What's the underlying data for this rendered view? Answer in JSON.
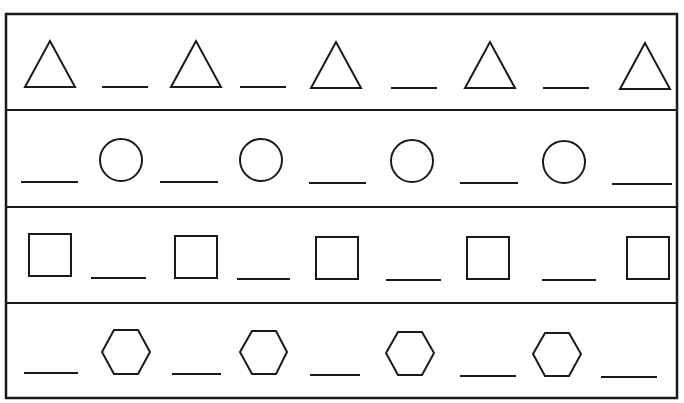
{
  "worksheet": {
    "type": "pattern-completion",
    "ink_color": "#1a1a1a",
    "background": "#ffffff",
    "rows": [
      {
        "name": "triangles",
        "sequence": [
          "triangle",
          "blank",
          "triangle",
          "blank",
          "triangle",
          "blank",
          "triangle",
          "blank",
          "triangle"
        ]
      },
      {
        "name": "circles",
        "sequence": [
          "blank",
          "circle",
          "blank",
          "circle",
          "blank",
          "circle",
          "blank",
          "circle",
          "blank"
        ]
      },
      {
        "name": "squares",
        "sequence": [
          "square",
          "blank",
          "square",
          "blank",
          "square",
          "blank",
          "square",
          "blank",
          "square"
        ]
      },
      {
        "name": "hexagons",
        "sequence": [
          "blank",
          "hexagon",
          "blank",
          "hexagon",
          "blank",
          "hexagon",
          "blank",
          "hexagon",
          "blank"
        ]
      }
    ]
  }
}
